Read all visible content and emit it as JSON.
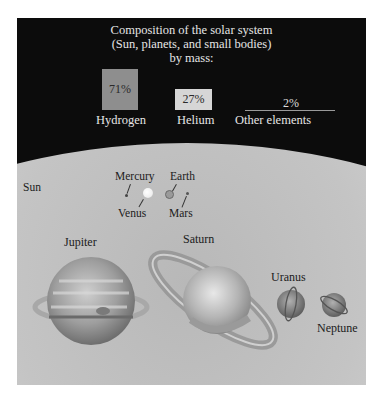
{
  "title": {
    "line1": "Composition of the solar system",
    "line2": "(Sun, planets, and small bodies)",
    "line3": "by mass:"
  },
  "composition": [
    {
      "element": "Hydrogen",
      "percent": "71%",
      "color": "#8e8e8e"
    },
    {
      "element": "Helium",
      "percent": "27%",
      "color": "#d6d6d6"
    },
    {
      "element": "Other elements",
      "percent": "2%",
      "color": "#9a9a9a"
    }
  ],
  "bodies": {
    "sun": "Sun",
    "mercury": "Mercury",
    "venus": "Venus",
    "earth": "Earth",
    "mars": "Mars",
    "jupiter": "Jupiter",
    "saturn": "Saturn",
    "uranus": "Uranus",
    "neptune": "Neptune"
  },
  "colors": {
    "background": "#0c0c0c",
    "sun": "#c8c8c8",
    "title_text": "#e6e6e6"
  }
}
